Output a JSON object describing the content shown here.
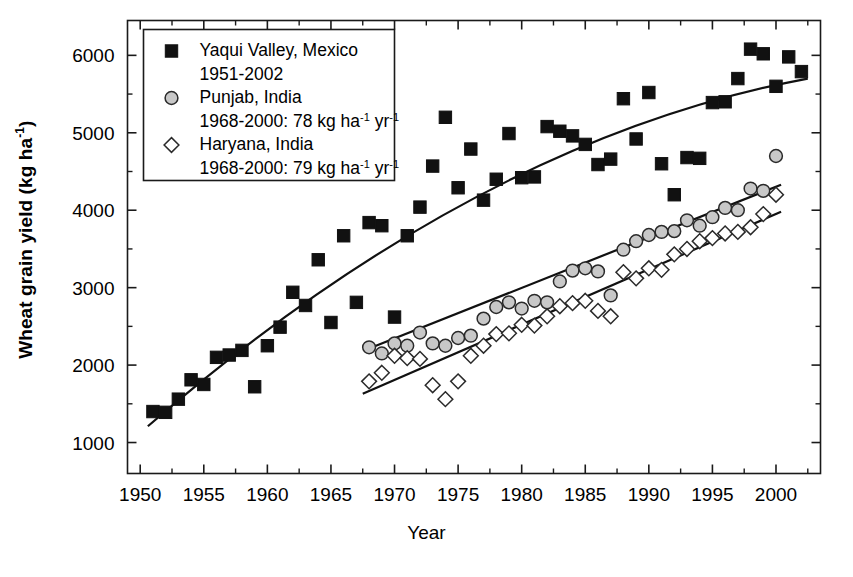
{
  "chart_data": {
    "type": "scatter",
    "title": "",
    "xlabel": "Year",
    "ylabel": "Wheat grain yield (kg ha⁻¹)",
    "ylabel_plain": "Wheat grain yield (kg ha",
    "ylabel_sup": "-1",
    "ylabel_tail": ")",
    "xlim": [
      1949.0,
      2003.5
    ],
    "ylim": [
      600,
      6450
    ],
    "grid": false,
    "legend_position": "top-left",
    "xticks": [
      1950,
      1955,
      1960,
      1965,
      1970,
      1975,
      1980,
      1985,
      1990,
      1995,
      2000
    ],
    "xtick_labels": [
      "1950",
      "1955",
      "1960",
      "1965",
      "1970",
      "1975",
      "1980",
      "1985",
      "1990",
      "1995",
      "2000"
    ],
    "xminor_step": 2.5,
    "yticks": [
      1000,
      2000,
      3000,
      4000,
      5000,
      6000
    ],
    "ytick_labels": [
      "1000",
      "2000",
      "3000",
      "4000",
      "5000",
      "6000"
    ],
    "yminor_step": 500,
    "series": [
      {
        "name": "Yaqui Valley, Mexico",
        "marker": "filled-square",
        "color": "#111111",
        "fill": "#111111",
        "legend_line1": "Yaqui Valley, Mexico",
        "legend_line2": "1951-2002",
        "points": [
          [
            1951,
            1400
          ],
          [
            1952,
            1390
          ],
          [
            1953,
            1560
          ],
          [
            1954,
            1810
          ],
          [
            1955,
            1750
          ],
          [
            1956,
            2100
          ],
          [
            1957,
            2130
          ],
          [
            1958,
            2190
          ],
          [
            1959,
            1720
          ],
          [
            1960,
            2250
          ],
          [
            1961,
            2490
          ],
          [
            1962,
            2940
          ],
          [
            1963,
            2770
          ],
          [
            1964,
            3360
          ],
          [
            1965,
            2550
          ],
          [
            1966,
            3670
          ],
          [
            1967,
            2810
          ],
          [
            1968,
            3840
          ],
          [
            1969,
            3800
          ],
          [
            1970,
            2620
          ],
          [
            1971,
            3670
          ],
          [
            1972,
            4040
          ],
          [
            1973,
            4570
          ],
          [
            1974,
            5200
          ],
          [
            1975,
            4290
          ],
          [
            1976,
            4790
          ],
          [
            1977,
            4130
          ],
          [
            1978,
            4400
          ],
          [
            1979,
            4990
          ],
          [
            1980,
            4420
          ],
          [
            1981,
            4430
          ],
          [
            1982,
            5080
          ],
          [
            1983,
            5020
          ],
          [
            1984,
            4960
          ],
          [
            1985,
            4850
          ],
          [
            1986,
            4590
          ],
          [
            1987,
            4660
          ],
          [
            1988,
            5440
          ],
          [
            1989,
            4920
          ],
          [
            1990,
            5520
          ],
          [
            1991,
            4600
          ],
          [
            1992,
            4200
          ],
          [
            1993,
            4680
          ],
          [
            1994,
            4670
          ],
          [
            1995,
            5390
          ],
          [
            1996,
            5400
          ],
          [
            1997,
            5700
          ],
          [
            1998,
            6080
          ],
          [
            1999,
            6020
          ],
          [
            2000,
            5600
          ],
          [
            2001,
            5980
          ],
          [
            2002,
            5790
          ]
        ],
        "trend": {
          "type": "quadratic",
          "x_start": 1950.6,
          "x_end": 2002.5,
          "y_start": 1210,
          "y_mid": 4180,
          "y_end": 5700
        }
      },
      {
        "name": "Punjab, India",
        "marker": "filled-circle",
        "color": "#2a2a2a",
        "fill": "#c8c8c8",
        "legend_line1": "Punjab, India",
        "legend_line2_pre": "1968-2000: 78 kg ha",
        "legend_line2_sup1": "-1",
        "legend_line2_mid": " yr",
        "legend_line2_sup2": "-1",
        "rate": 78,
        "rate_units": "kg ha-1 yr-1",
        "period": "1968-2000",
        "points": [
          [
            1968,
            2230
          ],
          [
            1969,
            2150
          ],
          [
            1970,
            2280
          ],
          [
            1971,
            2250
          ],
          [
            1972,
            2420
          ],
          [
            1973,
            2280
          ],
          [
            1974,
            2250
          ],
          [
            1975,
            2350
          ],
          [
            1976,
            2380
          ],
          [
            1977,
            2600
          ],
          [
            1978,
            2750
          ],
          [
            1979,
            2810
          ],
          [
            1980,
            2730
          ],
          [
            1981,
            2830
          ],
          [
            1982,
            2810
          ],
          [
            1983,
            3080
          ],
          [
            1984,
            3220
          ],
          [
            1985,
            3250
          ],
          [
            1986,
            3210
          ],
          [
            1987,
            2900
          ],
          [
            1988,
            3490
          ],
          [
            1989,
            3600
          ],
          [
            1990,
            3680
          ],
          [
            1991,
            3720
          ],
          [
            1992,
            3730
          ],
          [
            1993,
            3870
          ],
          [
            1994,
            3800
          ],
          [
            1995,
            3910
          ],
          [
            1996,
            4030
          ],
          [
            1997,
            4000
          ],
          [
            1998,
            4280
          ],
          [
            1999,
            4250
          ],
          [
            2000,
            4700
          ]
        ],
        "trend": {
          "type": "linear",
          "x_start": 1967.8,
          "x_end": 2000.4,
          "y_start": 2200,
          "y_end": 4330
        }
      },
      {
        "name": "Haryana, India",
        "marker": "open-diamond",
        "color": "#2a2a2a",
        "fill": "#ffffff",
        "legend_line1": "Haryana, India",
        "legend_line2_pre": "1968-2000: 79 kg ha",
        "legend_line2_sup1": "-1",
        "legend_line2_mid": " yr",
        "legend_line2_sup2": "-1",
        "rate": 79,
        "rate_units": "kg ha-1 yr-1",
        "period": "1968-2000",
        "points": [
          [
            1968,
            1790
          ],
          [
            1969,
            1900
          ],
          [
            1970,
            2120
          ],
          [
            1971,
            2090
          ],
          [
            1972,
            2080
          ],
          [
            1973,
            1740
          ],
          [
            1974,
            1560
          ],
          [
            1975,
            1790
          ],
          [
            1976,
            2120
          ],
          [
            1977,
            2250
          ],
          [
            1978,
            2400
          ],
          [
            1979,
            2410
          ],
          [
            1980,
            2520
          ],
          [
            1981,
            2510
          ],
          [
            1982,
            2630
          ],
          [
            1983,
            2760
          ],
          [
            1984,
            2800
          ],
          [
            1985,
            2830
          ],
          [
            1986,
            2700
          ],
          [
            1987,
            2630
          ],
          [
            1988,
            3200
          ],
          [
            1989,
            3120
          ],
          [
            1990,
            3250
          ],
          [
            1991,
            3230
          ],
          [
            1992,
            3430
          ],
          [
            1993,
            3500
          ],
          [
            1994,
            3600
          ],
          [
            1995,
            3640
          ],
          [
            1996,
            3700
          ],
          [
            1997,
            3720
          ],
          [
            1998,
            3780
          ],
          [
            1999,
            3950
          ],
          [
            2000,
            4200
          ]
        ],
        "trend": {
          "type": "linear",
          "x_start": 1967.5,
          "x_end": 2000.4,
          "y_start": 1630,
          "y_end": 3980
        }
      }
    ]
  }
}
